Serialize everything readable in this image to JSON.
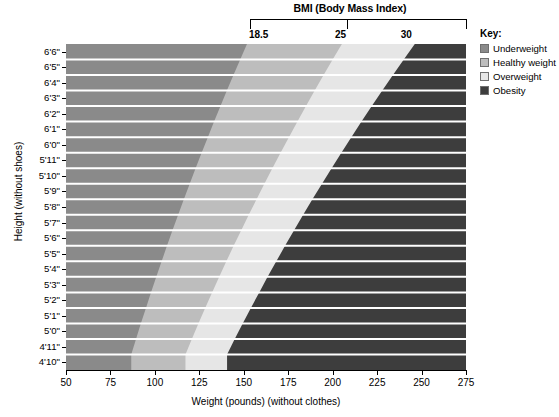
{
  "chart_data": {
    "type": "area",
    "title": "BMI (Body Mass Index)",
    "xlabel": "Weight (pounds) (without clothes)",
    "ylabel": "Height (without shoes)",
    "xlim": [
      50,
      275
    ],
    "ylim_heights": [
      "4'10\"",
      "6'6\""
    ],
    "grid": true,
    "legend_position": "right",
    "x_ticks": [
      50,
      75,
      100,
      125,
      150,
      175,
      200,
      225,
      250,
      275
    ],
    "x_tick_labels": [
      "50",
      "75",
      "100",
      "125",
      "150",
      "175",
      "200",
      "225",
      "250",
      "275"
    ],
    "bmi_ticks": [
      18.5,
      25,
      30
    ],
    "bmi_tick_labels": [
      "18.5",
      "25",
      "30"
    ],
    "height_labels": [
      "6'6\"",
      "6'5\"",
      "6'4\"",
      "6'3\"",
      "6'2\"",
      "6'1\"",
      "6'0\"",
      "5'11\"",
      "5'10\"",
      "5'9\"",
      "5'8\"",
      "5'7\"",
      "5'6\"",
      "5'5\"",
      "5'4\"",
      "5'3\"",
      "5'2\"",
      "5'1\"",
      "5'0\"",
      "4'11\"",
      "4'10\""
    ],
    "height_inches": [
      78,
      77,
      76,
      75,
      74,
      73,
      72,
      71,
      70,
      69,
      68,
      67,
      66,
      65,
      64,
      63,
      62,
      61,
      60,
      59,
      58
    ],
    "bands": [
      {
        "name": "Underweight",
        "bmi_range": [
          0,
          18.5
        ],
        "color": "#8a8a8a"
      },
      {
        "name": "Healthy weight",
        "bmi_range": [
          18.5,
          25
        ],
        "color": "#bdbdbd"
      },
      {
        "name": "Overweight",
        "bmi_range": [
          25,
          30
        ],
        "color": "#e6e6e6"
      },
      {
        "name": "Obesity",
        "bmi_range": [
          30,
          999
        ],
        "color": "#3d3d3d"
      }
    ],
    "boundary_weights_lbs": {
      "note": "weight at each BMI isoline per height row, lbs",
      "bmi_18_5": [
        151.8,
        148.0,
        144.2,
        140.5,
        136.9,
        133.3,
        129.8,
        126.3,
        122.9,
        119.6,
        116.3,
        113.1,
        109.9,
        106.8,
        103.8,
        100.8,
        97.8,
        95.0,
        92.1,
        89.4,
        86.7
      ],
      "bmi_25": [
        205.2,
        200.0,
        194.9,
        189.9,
        185.0,
        180.2,
        175.4,
        170.7,
        166.1,
        161.6,
        157.2,
        152.8,
        148.6,
        144.3,
        140.2,
        136.2,
        132.2,
        128.3,
        124.5,
        120.8,
        117.2
      ],
      "bmi_30": [
        246.2,
        240.0,
        233.9,
        227.9,
        222.0,
        216.2,
        210.5,
        204.9,
        199.4,
        194.0,
        188.6,
        183.4,
        178.3,
        173.2,
        168.3,
        163.4,
        158.7,
        154.0,
        149.4,
        144.9,
        140.6
      ]
    }
  },
  "header": {
    "bmi_axis_title": "BMI (Body Mass Index)",
    "bmi_labels": [
      "18.5",
      "25",
      "30"
    ]
  },
  "axes": {
    "x_title": "Weight (pounds) (without clothes)",
    "y_title": "Height (without shoes)",
    "x_labels": [
      "50",
      "75",
      "100",
      "125",
      "150",
      "175",
      "200",
      "225",
      "250",
      "275"
    ],
    "y_labels": [
      "6'6\"",
      "6'5\"",
      "6'4\"",
      "6'3\"",
      "6'2\"",
      "6'1\"",
      "6'0\"",
      "5'11\"",
      "5'10\"",
      "5'9\"",
      "5'8\"",
      "5'7\"",
      "5'6\"",
      "5'5\"",
      "5'4\"",
      "5'3\"",
      "5'2\"",
      "5'1\"",
      "5'0\"",
      "4'11\"",
      "4'10\""
    ]
  },
  "legend": {
    "title": "Key:",
    "items": [
      {
        "label": "Underweight",
        "color": "#8a8a8a"
      },
      {
        "label": "Healthy weight",
        "color": "#bdbdbd"
      },
      {
        "label": "Overweight",
        "color": "#e6e6e6"
      },
      {
        "label": "Obesity",
        "color": "#3d3d3d"
      }
    ]
  }
}
